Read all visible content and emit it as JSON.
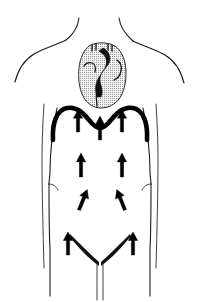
{
  "figure": {
    "background_color": "#ffffff",
    "line_color": "#1a1a1a",
    "diaphragm_color": "#000000",
    "heart_fill_color": "#c8c8c8",
    "arrow_color": "#000000",
    "width": 200,
    "height": 302
  },
  "anatomy": {
    "parts": [
      {
        "id": "neck",
        "label": "Neck"
      },
      {
        "id": "shoulders",
        "label": "Shoulders"
      },
      {
        "id": "left-arm",
        "label": "Left arm"
      },
      {
        "id": "right-arm",
        "label": "Right arm"
      },
      {
        "id": "torso",
        "label": "Torso outline"
      },
      {
        "id": "heart",
        "label": "Heart"
      },
      {
        "id": "diaphragm",
        "label": "Diaphragm"
      },
      {
        "id": "waist-left",
        "label": "Left waist crease"
      },
      {
        "id": "waist-right",
        "label": "Right waist crease"
      },
      {
        "id": "inguinal-left",
        "label": "Left inguinal fold"
      },
      {
        "id": "inguinal-right",
        "label": "Right inguinal fold"
      },
      {
        "id": "genitalia",
        "label": "Genitalia outline"
      }
    ]
  },
  "flow_arrows": {
    "label": "Upward flow arrows",
    "count": 9,
    "direction": "upward",
    "items": [
      {
        "id": "arrow-top-left",
        "label": "Upper left abdominal arrow",
        "x": 78,
        "y": 132,
        "length": 22,
        "rotation": 0
      },
      {
        "id": "arrow-top-center",
        "label": "Central subdiaphragmatic arrow",
        "x": 100,
        "y": 140,
        "length": 24,
        "rotation": 0
      },
      {
        "id": "arrow-top-right",
        "label": "Upper right abdominal arrow",
        "x": 122,
        "y": 132,
        "length": 22,
        "rotation": 0
      },
      {
        "id": "arrow-mid-left",
        "label": "Mid left abdominal arrow",
        "x": 81,
        "y": 177,
        "length": 24,
        "rotation": 0
      },
      {
        "id": "arrow-mid-right",
        "label": "Mid right abdominal arrow",
        "x": 122,
        "y": 177,
        "length": 24,
        "rotation": 0
      },
      {
        "id": "arrow-lower-left",
        "label": "Lower left abdominal arrow",
        "x": 79,
        "y": 210,
        "length": 22,
        "rotation": 22
      },
      {
        "id": "arrow-lower-right",
        "label": "Lower right abdominal arrow",
        "x": 125,
        "y": 210,
        "length": 22,
        "rotation": -22
      },
      {
        "id": "arrow-inguinal-left",
        "label": "Left inguinal arrow",
        "x": 68,
        "y": 255,
        "length": 23,
        "rotation": 0
      },
      {
        "id": "arrow-inguinal-right",
        "label": "Right inguinal arrow",
        "x": 133,
        "y": 255,
        "length": 23,
        "rotation": 0
      }
    ]
  }
}
